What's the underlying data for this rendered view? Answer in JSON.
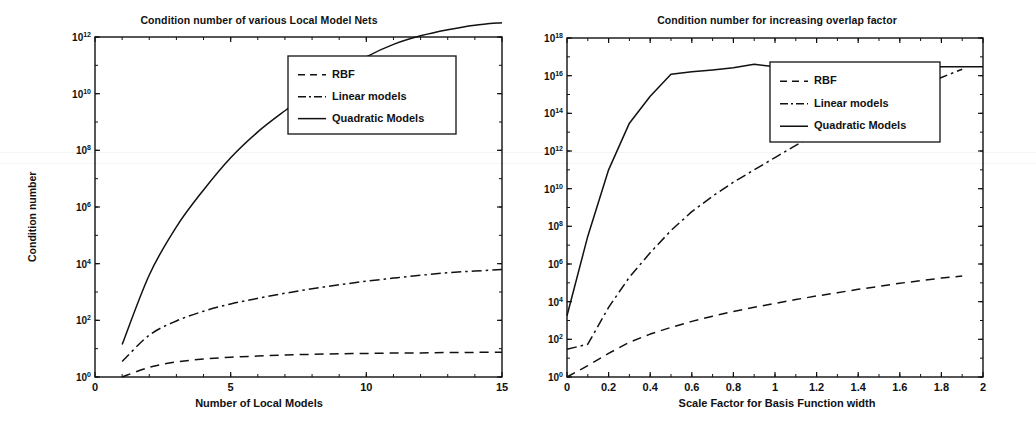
{
  "figure": {
    "width": 1036,
    "height": 439,
    "background": "#ffffff",
    "ink_color": "#111111"
  },
  "chart_data": [
    {
      "type": "line",
      "panel": "left",
      "title": "Condition number of various Local Model Nets",
      "xlabel": "Number of Local Models",
      "ylabel": "Condition number",
      "xscale": "linear",
      "yscale": "log",
      "xlim": [
        0,
        15
      ],
      "ylim": [
        1,
        1000000000000.0
      ],
      "grid": false,
      "xticks": [
        0,
        5,
        10,
        15
      ],
      "xticklabels": [
        "0",
        "5",
        "10",
        "15"
      ],
      "yticks": [
        1,
        100,
        10000,
        1000000,
        100000000,
        10000000000,
        1000000000000
      ],
      "yticklabels": [
        "10^0",
        "10^2",
        "10^4",
        "10^6",
        "10^8",
        "10^10",
        "10^12"
      ],
      "legend_position": "upper center",
      "series": [
        {
          "name": "RBF",
          "style": "dashed",
          "x": [
            1,
            2,
            3,
            4,
            5,
            6,
            7,
            8,
            9,
            10,
            11,
            12,
            13,
            14,
            15
          ],
          "y": [
            1.0,
            2.2,
            3.4,
            4.3,
            5.0,
            5.5,
            6.0,
            6.3,
            6.6,
            6.8,
            7.0,
            7.1,
            7.3,
            7.4,
            7.5
          ]
        },
        {
          "name": "Linear models",
          "style": "dashdot",
          "x": [
            1,
            2,
            3,
            4,
            5,
            6,
            7,
            8,
            9,
            10,
            11,
            12,
            13,
            14,
            15
          ],
          "y": [
            3.5,
            30,
            95,
            210,
            380,
            600,
            900,
            1300,
            1800,
            2400,
            3100,
            3900,
            4800,
            5500,
            6200
          ]
        },
        {
          "name": "Quadratic Models",
          "style": "solid",
          "x": [
            1,
            2,
            3,
            4,
            5,
            6,
            7,
            8,
            9,
            10,
            11,
            12,
            13,
            14,
            15
          ],
          "y": [
            14,
            4000,
            200000,
            4000000,
            55000000.0,
            450000000.0,
            2500000000.0,
            12000000000.0,
            55000000000.0,
            200000000000.0,
            550000000000.0,
            1100000000000.0,
            1800000000000.0,
            2600000000000.0,
            3200000000000.0
          ]
        }
      ]
    },
    {
      "type": "line",
      "panel": "right",
      "title": "Condition number for increasing overlap factor",
      "xlabel": "Scale Factor for Basis Function width",
      "ylabel": "Condition number",
      "xscale": "linear",
      "yscale": "log",
      "xlim": [
        0,
        2
      ],
      "ylim": [
        1,
        1e+18
      ],
      "grid": false,
      "xticks": [
        0,
        0.2,
        0.4,
        0.6,
        0.8,
        1,
        1.2,
        1.4,
        1.6,
        1.8,
        2
      ],
      "xticklabels": [
        "0",
        "0.2",
        "0.4",
        "0.6",
        "0.8",
        "1",
        "1.2",
        "1.4",
        "1.6",
        "1.8",
        "2"
      ],
      "yticks": [
        1,
        100,
        10000,
        1000000,
        100000000,
        10000000000,
        1000000000000,
        100000000000000,
        1e+16,
        1e+18
      ],
      "yticklabels": [
        "10^0",
        "10^2",
        "10^4",
        "10^6",
        "10^8",
        "10^10",
        "10^12",
        "10^14",
        "10^16",
        "10^18"
      ],
      "legend_position": "upper right",
      "series": [
        {
          "name": "RBF",
          "style": "dashed",
          "x": [
            0.0,
            0.1,
            0.2,
            0.3,
            0.4,
            0.5,
            0.6,
            0.7,
            0.8,
            0.9,
            1.0,
            1.1,
            1.2,
            1.3,
            1.4,
            1.5,
            1.6,
            1.7,
            1.8,
            1.9
          ],
          "y": [
            1.0,
            4,
            18,
            70,
            190,
            430,
            900,
            1700,
            3000,
            5000,
            8000,
            13000,
            20000,
            30000,
            45000,
            65000,
            95000,
            130000,
            180000,
            230000
          ]
        },
        {
          "name": "Linear models",
          "style": "dashdot",
          "x": [
            0.0,
            0.1,
            0.2,
            0.3,
            0.4,
            0.5,
            0.6,
            0.7,
            0.8,
            0.9,
            1.0,
            1.1,
            1.2,
            1.3,
            1.4,
            1.5,
            1.6,
            1.7,
            1.8,
            1.9
          ],
          "y": [
            30,
            55,
            5000,
            200000,
            4000000,
            60000000.0,
            600000000.0,
            4000000000.0,
            22000000000.0,
            100000000000.0,
            450000000000.0,
            2000000000000.0,
            8000000000000.0,
            30000000000000.0,
            100000000000000.0,
            350000000000000.0,
            1100000000000000.0,
            3000000000000000.0,
            8000000000000000.0,
            2.2e+16
          ]
        },
        {
          "name": "Quadratic Models",
          "style": "solid",
          "x": [
            0.0,
            0.1,
            0.2,
            0.3,
            0.4,
            0.5,
            0.6,
            0.7,
            0.8,
            0.9,
            1.0,
            1.1,
            1.2,
            1.3,
            1.4,
            1.5,
            1.6,
            1.7,
            1.8,
            1.9,
            2.0
          ],
          "y": [
            1800,
            30000000.0,
            100000000000.0,
            30000000000000.0,
            800000000000000.0,
            1.2e+16,
            1.6e+16,
            2e+16,
            2.6e+16,
            4e+16,
            3e+16,
            3e+16,
            3e+16,
            3e+16,
            3e+16,
            3e+16,
            3e+16,
            3e+16,
            3e+16,
            3e+16,
            3e+16
          ]
        }
      ]
    }
  ],
  "left": {
    "title": "Condition number of various Local Model Nets",
    "xlabel": "Number of Local Models",
    "ylabel": "Condition number",
    "xticklabels": [
      "0",
      "5",
      "10",
      "15"
    ],
    "yticklabels": [
      "10",
      "10",
      "10",
      "10",
      "10",
      "10",
      "10"
    ],
    "yexponents": [
      "12",
      "10",
      "8",
      "6",
      "4",
      "2",
      "0"
    ],
    "legend": [
      "RBF",
      "Linear models",
      "Quadratic Models"
    ]
  },
  "right": {
    "title": "Condition number for increasing overlap factor",
    "xlabel": "Scale Factor for Basis Function width",
    "ylabel": "Condition number",
    "xticklabels": [
      "0",
      "0.2",
      "0.4",
      "0.6",
      "0.8",
      "1",
      "1.2",
      "1.4",
      "1.6",
      "1.8",
      "2"
    ],
    "yticklabels": [
      "10",
      "10",
      "10",
      "10",
      "10",
      "10",
      "10",
      "10",
      "10",
      "10"
    ],
    "yexponents": [
      "18",
      "16",
      "14",
      "12",
      "10",
      "8",
      "6",
      "4",
      "2",
      "0"
    ],
    "legend": [
      "RBF",
      "Linear models",
      "Quadratic Models"
    ]
  }
}
